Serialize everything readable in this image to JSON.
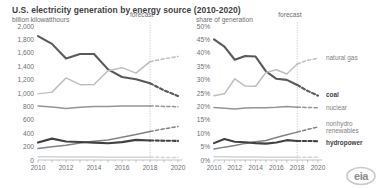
{
  "header": {
    "title_main": "U.S. electricity generation by energy source",
    "title_range": "(2010-2020)",
    "subtitle_left": "billion kilowatthours",
    "subtitle_right": "share of generation"
  },
  "logo": {
    "text": "eia"
  },
  "annotations": {
    "forecast_label": "forecast",
    "forecast_year": 2018
  },
  "series_labels": {
    "natural_gas": "natural gas",
    "coal": "coal",
    "nuclear": "nuclear",
    "nonhydro_1": "nonhydro",
    "nonhydro_2": "renewables",
    "hydropower": "hydropower"
  },
  "colors": {
    "coal": "#58595b",
    "natural_gas": "#bcbec0",
    "nuclear": "#939598",
    "nonhydro": "#808285",
    "hydropower": "#414042",
    "other": "#d1d3d4",
    "axis": "#a7a9ac",
    "forecast_line": "#bcbec0"
  },
  "chart_data": [
    {
      "type": "line",
      "id": "generation-absolute",
      "title": "U.S. electricity generation by energy source (2010-2020)",
      "subtitle": "billion kilowatthours",
      "xlabel": "",
      "ylabel": "billion kilowatthours",
      "ylim": [
        0,
        2000
      ],
      "ytick_values": [
        0,
        200,
        400,
        600,
        800,
        1000,
        1200,
        1400,
        1600,
        1800,
        2000
      ],
      "ytick_labels": [
        "0",
        "200",
        "400",
        "600",
        "800",
        "1,000",
        "1,200",
        "1,400",
        "1,600",
        "1,800",
        "2,000"
      ],
      "x": [
        2010,
        2011,
        2012,
        2013,
        2014,
        2015,
        2016,
        2017,
        2018,
        2019,
        2020
      ],
      "xtick_values": [
        2010,
        2012,
        2014,
        2016,
        2018,
        2020
      ],
      "xtick_labels": [
        "2010",
        "2012",
        "2014",
        "2016",
        "2018",
        "2020"
      ],
      "grid": false,
      "legend_position": "right",
      "forecast_start": 2018,
      "series": [
        {
          "name": "coal",
          "values": [
            1850,
            1733,
            1514,
            1581,
            1582,
            1352,
            1239,
            1206,
            1146,
            1040,
            955
          ]
        },
        {
          "name": "natural gas",
          "values": [
            987,
            1013,
            1225,
            1124,
            1126,
            1333,
            1378,
            1296,
            1468,
            1510,
            1545
          ]
        },
        {
          "name": "nuclear",
          "values": [
            807,
            790,
            769,
            789,
            797,
            797,
            805,
            805,
            807,
            800,
            795
          ]
        },
        {
          "name": "nonhydro renewables",
          "values": [
            170,
            197,
            219,
            253,
            279,
            299,
            341,
            381,
            425,
            465,
            500
          ]
        },
        {
          "name": "hydropower",
          "values": [
            260,
            319,
            277,
            269,
            259,
            250,
            267,
            300,
            292,
            288,
            285
          ]
        },
        {
          "name": "other",
          "values": [
            50,
            48,
            46,
            45,
            44,
            42,
            41,
            40,
            40,
            39,
            38
          ]
        }
      ]
    },
    {
      "type": "line",
      "id": "generation-share",
      "title": "U.S. electricity generation by energy source (2010-2020)",
      "subtitle": "share of generation",
      "xlabel": "",
      "ylabel": "share of generation",
      "ylim": [
        0,
        50
      ],
      "ytick_values": [
        0,
        5,
        10,
        15,
        20,
        25,
        30,
        35,
        40,
        45,
        50
      ],
      "ytick_labels": [
        "0%",
        "5%",
        "10%",
        "15%",
        "20%",
        "25%",
        "30%",
        "35%",
        "40%",
        "45%",
        "50%"
      ],
      "x": [
        2010,
        2011,
        2012,
        2013,
        2014,
        2015,
        2016,
        2017,
        2018,
        2019,
        2020
      ],
      "xtick_values": [
        2010,
        2012,
        2014,
        2016,
        2018,
        2020
      ],
      "xtick_labels": [
        "2010",
        "2012",
        "2014",
        "2016",
        "2018",
        "2020"
      ],
      "grid": false,
      "legend_position": "right",
      "forecast_start": 2018,
      "series": [
        {
          "name": "coal",
          "values": [
            45.0,
            42.3,
            37.4,
            38.8,
            38.6,
            33.1,
            30.3,
            29.9,
            28.0,
            25.8,
            24.0
          ]
        },
        {
          "name": "natural gas",
          "values": [
            24.0,
            24.7,
            30.3,
            27.6,
            27.5,
            32.7,
            33.7,
            32.1,
            35.8,
            37.2,
            38.0
          ]
        },
        {
          "name": "nuclear",
          "values": [
            19.6,
            19.3,
            19.0,
            19.4,
            19.5,
            19.5,
            19.7,
            20.0,
            19.7,
            19.6,
            19.5
          ]
        },
        {
          "name": "nonhydro renewables",
          "values": [
            4.1,
            4.8,
            5.4,
            6.2,
            6.8,
            7.3,
            8.4,
            9.4,
            10.4,
            11.4,
            12.3
          ]
        },
        {
          "name": "hydropower",
          "values": [
            6.3,
            7.8,
            6.8,
            6.6,
            6.3,
            6.1,
            6.5,
            7.4,
            7.1,
            7.1,
            7.0
          ]
        },
        {
          "name": "other",
          "values": [
            1.2,
            1.2,
            1.1,
            1.1,
            1.1,
            1.0,
            1.0,
            1.0,
            1.0,
            1.0,
            1.0
          ]
        }
      ]
    }
  ]
}
